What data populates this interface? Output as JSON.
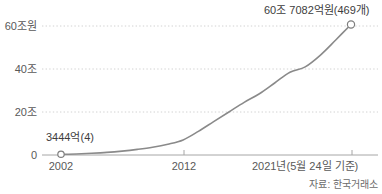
{
  "chart_data": {
    "type": "line",
    "title": "",
    "xlabel": "",
    "ylabel": "",
    "ylim": [
      0,
      62
    ],
    "xlim": [
      2002,
      2021
    ],
    "grid": "dotted-horizontal",
    "legend": "none",
    "unit": "조원",
    "y_ticks": [
      {
        "value": 60,
        "label": "60조원"
      },
      {
        "value": 40,
        "label": "40조"
      },
      {
        "value": 20,
        "label": "20조"
      },
      {
        "value": 0,
        "label": "0"
      }
    ],
    "x_ticks": [
      {
        "value": 2002,
        "label": "2002"
      },
      {
        "value": 2012,
        "label": "2012"
      },
      {
        "value": 2021,
        "label": "2021년(5월 24일 기준)"
      }
    ],
    "x": [
      2002,
      2003,
      2004,
      2005,
      2006,
      2007,
      2008,
      2009,
      2010,
      2011,
      2012,
      2013,
      2014,
      2015,
      2016,
      2017,
      2018,
      2019,
      2020,
      2021
    ],
    "values": [
      0.3444,
      0.5,
      0.8,
      1.2,
      1.8,
      2.6,
      3.6,
      5.0,
      7.0,
      11.0,
      15.5,
      20.0,
      24.5,
      28.5,
      33.5,
      38.5,
      41.0,
      46.5,
      53.5,
      60.7082
    ],
    "series": [
      {
        "name": "ETF 순자산총액",
        "values": [
          0.3444,
          0.5,
          0.8,
          1.2,
          1.8,
          2.6,
          3.6,
          5.0,
          7.0,
          11.0,
          15.5,
          20.0,
          24.5,
          28.5,
          33.5,
          38.5,
          41.0,
          46.5,
          53.5,
          60.7082
        ]
      }
    ],
    "annotations": [
      {
        "name": "start-point",
        "x": 2002,
        "y": 0.3444,
        "text": "3444억(4)"
      },
      {
        "name": "end-point",
        "x": 2021,
        "y": 60.7082,
        "text": "60조 7082억원(469개)"
      }
    ],
    "markers": [
      {
        "x": 2002,
        "y": 0.3444
      },
      {
        "x": 2021,
        "y": 60.7082
      }
    ],
    "source": "자료: 한국거래소",
    "colors": {
      "line": "#8a8a8a",
      "axis": "#9a9a9a",
      "grid": "#d2d2d2",
      "text": "#595959",
      "marker_fill": "#ffffff",
      "marker_stroke": "#7e7e7e"
    }
  }
}
